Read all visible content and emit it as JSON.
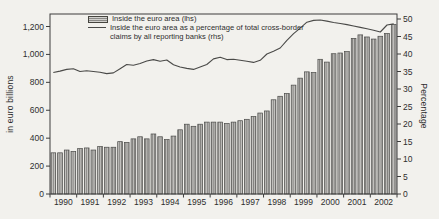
{
  "panel": {
    "background": "#f2f1ed"
  },
  "chart_data": {
    "type": "bar+line",
    "frequency": "quarterly",
    "categories_years": [
      "1990",
      "1991",
      "1992",
      "1993",
      "1994",
      "1995",
      "1996",
      "1997",
      "1998",
      "1999",
      "2000",
      "2001",
      "2002"
    ],
    "series": [
      {
        "name": "Inside the euro area (lhs)",
        "type": "bar",
        "axis": "left",
        "values": [
          295,
          295,
          315,
          305,
          325,
          330,
          315,
          340,
          335,
          335,
          375,
          370,
          395,
          410,
          395,
          430,
          410,
          390,
          415,
          460,
          500,
          485,
          500,
          515,
          515,
          515,
          505,
          515,
          525,
          535,
          555,
          580,
          595,
          675,
          700,
          720,
          780,
          830,
          875,
          870,
          965,
          945,
          1005,
          1010,
          1020,
          1115,
          1140,
          1125,
          1110,
          1130,
          1150,
          1215
        ]
      },
      {
        "name": "Inside the euro area as a percentage of total cross-border claims by all reporting banks (rhs)",
        "type": "line",
        "axis": "right",
        "values": [
          34.7,
          35.1,
          35.6,
          35.8,
          35.0,
          35.2,
          35.0,
          34.8,
          34.4,
          34.6,
          35.8,
          37.0,
          36.8,
          37.3,
          38.0,
          38.4,
          37.9,
          38.3,
          36.9,
          36.3,
          35.9,
          35.6,
          36.3,
          37.0,
          38.6,
          39.1,
          38.4,
          38.5,
          38.2,
          37.9,
          37.6,
          38.2,
          40.0,
          40.8,
          41.7,
          43.9,
          45.8,
          47.4,
          49.1,
          49.6,
          49.7,
          49.4,
          49.0,
          48.7,
          48.4,
          48.0,
          47.6,
          47.2,
          46.8,
          46.3,
          48.3,
          48.6
        ]
      }
    ],
    "left_axis": {
      "label": "in euro billions",
      "min": 0,
      "max": 1200,
      "step": 200,
      "tick_labels": [
        "0",
        "200",
        "400",
        "600",
        "800",
        "1,000",
        "1,200"
      ]
    },
    "right_axis": {
      "label": "Percentage",
      "min": 0,
      "max": 50,
      "step": 5,
      "tick_labels": [
        "0",
        "5",
        "10",
        "15",
        "20",
        "25",
        "30",
        "35",
        "40",
        "45",
        "50"
      ]
    },
    "legend": {
      "position": "top-left-inside",
      "entries": [
        {
          "symbol": "hatched-bar",
          "lines": [
            "Inside the euro area (lhs)"
          ]
        },
        {
          "symbol": "line",
          "lines": [
            "Inside the euro area as a percentage of total cross-border",
            "claims by all reporting banks (rhs)"
          ]
        }
      ]
    },
    "grid": false,
    "colors": {
      "bar_fill": "#c6c5c2",
      "bar_stripe": "#7d7c79",
      "bar_border": "#4a4a48",
      "line": "#4a4a48",
      "axis": "#3c3c3c",
      "text": "#2e2e2e"
    }
  }
}
